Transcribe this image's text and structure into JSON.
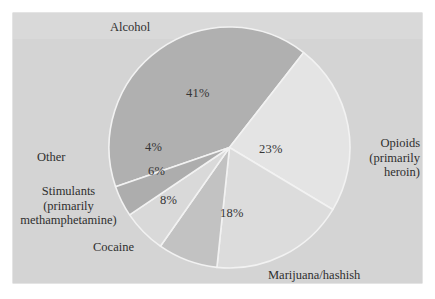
{
  "figure": {
    "background_color": "#d4d4d4",
    "page_color": "#ffffff",
    "label_color": "#2f2f2f"
  },
  "chart_data": {
    "type": "pie",
    "title": "",
    "subtitle": "",
    "xlabel": "",
    "ylabel": "",
    "legend_position": "none",
    "grid": false,
    "value_suffix": "%",
    "total": 100,
    "categories": [
      "Alcohol",
      "Opioids (primarily heroin)",
      "Marijuana/hashish",
      "Cocaine",
      "Stimulants (primarily methamphetamine)",
      "Other"
    ],
    "values": [
      41,
      23,
      18,
      8,
      6,
      4
    ],
    "slices": [
      {
        "name": "Alcohol",
        "label_lines": [
          "Alcohol"
        ],
        "value": 41,
        "value_label": "41%",
        "color": "#b0b0b0",
        "start_angle": 251,
        "end_angle": 398
      },
      {
        "name": "Opioids",
        "label_lines": [
          "Opioids",
          "(primarily",
          "heroin)"
        ],
        "value": 23,
        "value_label": "23%",
        "color": "#e4e4e4",
        "start_angle": 38,
        "end_angle": 121
      },
      {
        "name": "Marijuana/hashish",
        "label_lines": [
          "Marijuana/hashish"
        ],
        "value": 18,
        "value_label": "18%",
        "color": "#dcdcdc",
        "start_angle": 121,
        "end_angle": 186
      },
      {
        "name": "Cocaine",
        "label_lines": [
          "Cocaine"
        ],
        "value": 8,
        "value_label": "8%",
        "color": "#c2c2c2",
        "start_angle": 186,
        "end_angle": 215
      },
      {
        "name": "Stimulants",
        "label_lines": [
          "Stimulants",
          "(primarily",
          "methamphetamine)"
        ],
        "value": 6,
        "value_label": "6%",
        "color": "#d9d9d9",
        "start_angle": 215,
        "end_angle": 236
      },
      {
        "name": "Other",
        "label_lines": [
          "Other"
        ],
        "value": 4,
        "value_label": "4%",
        "color": "#adadad",
        "start_angle": 236,
        "end_angle": 251
      }
    ]
  },
  "labels": {
    "alcohol": "Alcohol",
    "opioids_line1": "Opioids",
    "opioids_line2": "(primarily",
    "opioids_line3": "heroin)",
    "marijuana": "Marijuana/hashish",
    "cocaine": "Cocaine",
    "stimulants_line1": "Stimulants",
    "stimulants_line2": "(primarily",
    "stimulants_line3": "methamphetamine)",
    "other": "Other"
  },
  "values": {
    "alcohol": "41%",
    "opioids": "23%",
    "marijuana": "18%",
    "cocaine": "8%",
    "stimulants": "6%",
    "other": "4%"
  }
}
